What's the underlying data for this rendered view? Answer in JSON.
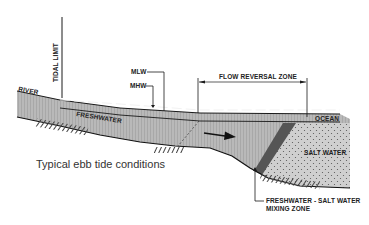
{
  "caption": "Typical ebb tide conditions",
  "labels": {
    "tidal_limit": "TIDAL LIMIT",
    "river": "RIVER",
    "mlw": "MLW",
    "mhw": "MHW",
    "flow_reversal_zone": "FLOW REVERSAL ZONE",
    "freshwater": "FRESHWATER",
    "ocean": "OCEAN",
    "salt_water": "SALT WATER",
    "mixing_zone_line1": "FRESHWATER - SALT WATER",
    "mixing_zone_line2": "MIXING ZONE"
  },
  "colors": {
    "water": "#b8b8b8",
    "water_stripe": "#a9a9a9",
    "salt_water": "#c9c9c9",
    "mixing_band": "#555555",
    "line": "#1a1a1a"
  }
}
